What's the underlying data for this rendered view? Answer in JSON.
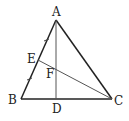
{
  "diagram": {
    "type": "triangle-geometry",
    "colors": {
      "line": "#222222",
      "thin_line": "#555555",
      "background": "#ffffff"
    },
    "points": {
      "A": {
        "label": "A",
        "x": 56,
        "y": 20
      },
      "B": {
        "label": "B",
        "x": 21,
        "y": 99
      },
      "C": {
        "label": "C",
        "x": 112,
        "y": 99
      },
      "D": {
        "label": "D",
        "x": 56,
        "y": 99
      },
      "E": {
        "label": "E",
        "x": 38,
        "y": 60
      },
      "F": {
        "label": "F",
        "x": 56,
        "y": 69
      }
    },
    "segments": [
      "AB",
      "BC",
      "CA",
      "AD",
      "EC"
    ],
    "marks": {
      "equal_ticks": [
        "AE",
        "EB"
      ]
    }
  }
}
